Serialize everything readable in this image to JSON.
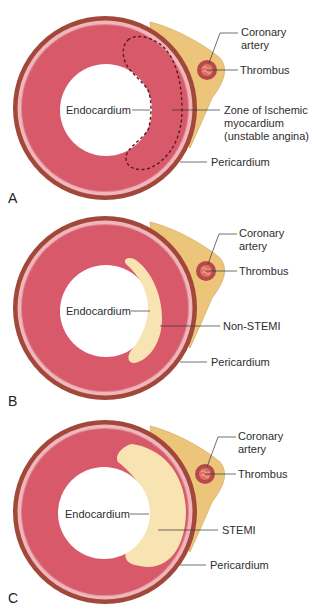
{
  "colors": {
    "pericardium": "#a1483a",
    "outer_pink": "#f1b5bb",
    "pink_line": "#d98790",
    "myocardium": "#d85a6a",
    "cavity": "#ffffff",
    "fat": "#ecc57a",
    "fat_edge": "#c9a050",
    "artery_wall": "#b64a4a",
    "thrombus": "#e07065",
    "infarct": "#f8e3b3",
    "dashed": "#5a1822",
    "leader": "#333333"
  },
  "panels": [
    {
      "letter": "A",
      "labels": {
        "coronary": "Coronary",
        "artery": "artery",
        "thrombus": "Thrombus",
        "endocardium": "Endocardium",
        "zone_line1": "Zone of Ischemic",
        "zone_line2": "myocardium",
        "zone_line3": "(unstable angina)",
        "pericardium": "Pericardium"
      }
    },
    {
      "letter": "B",
      "labels": {
        "coronary": "Coronary",
        "artery": "artery",
        "thrombus": "Thrombus",
        "endocardium": "Endocardium",
        "lesion": "Non-STEMI",
        "pericardium": "Pericardium"
      }
    },
    {
      "letter": "C",
      "labels": {
        "coronary": "Coronary",
        "artery": "artery",
        "thrombus": "Thrombus",
        "endocardium": "Endocardium",
        "lesion": "STEMI",
        "pericardium": "Pericardium"
      }
    }
  ]
}
